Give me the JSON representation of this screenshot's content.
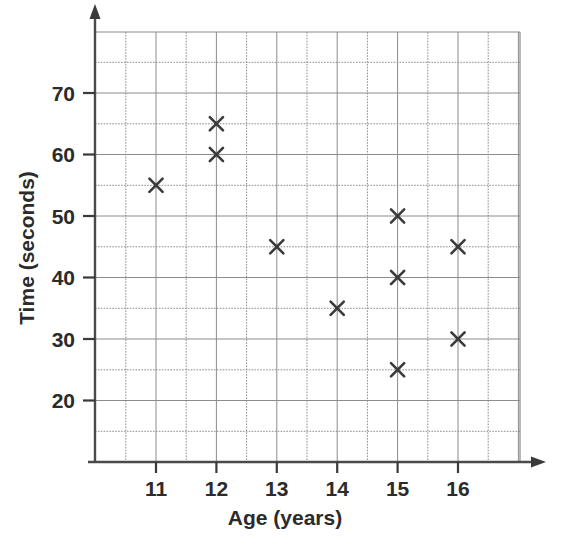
{
  "chart_data": {
    "type": "scatter",
    "title": "",
    "xlabel": "Age (years)",
    "ylabel": "Time (seconds)",
    "xlim": [
      10.3,
      17.0
    ],
    "ylim": [
      13.0,
      77.5
    ],
    "xticks": [
      11,
      12,
      13,
      14,
      15,
      16
    ],
    "yticks": [
      20,
      30,
      40,
      50,
      60,
      70
    ],
    "xtick_labels": [
      "11",
      "12",
      "13",
      "14",
      "15",
      "16"
    ],
    "ytick_labels": [
      "20",
      "30",
      "40",
      "50",
      "60",
      "70"
    ],
    "grid": true,
    "grid_major_x_step": 0.5,
    "grid_major_y_step": 5,
    "legend": "none",
    "marker": "x-cross",
    "marker_color": "#3a3a3a",
    "grid_color": "#8c8c8c",
    "axis_color": "#4a4a4a",
    "background": "#ffffff",
    "points": [
      {
        "x": 11,
        "y": 55
      },
      {
        "x": 12,
        "y": 65
      },
      {
        "x": 12,
        "y": 60
      },
      {
        "x": 13,
        "y": 45
      },
      {
        "x": 14,
        "y": 35
      },
      {
        "x": 15,
        "y": 50
      },
      {
        "x": 15,
        "y": 40
      },
      {
        "x": 15,
        "y": 25
      },
      {
        "x": 16,
        "y": 45
      },
      {
        "x": 16,
        "y": 30
      }
    ],
    "series": [
      {
        "name": "Age vs Time",
        "x": [
          11,
          12,
          12,
          13,
          14,
          15,
          15,
          15,
          16,
          16
        ],
        "values": [
          55,
          65,
          60,
          45,
          35,
          50,
          40,
          25,
          45,
          30
        ]
      }
    ]
  }
}
